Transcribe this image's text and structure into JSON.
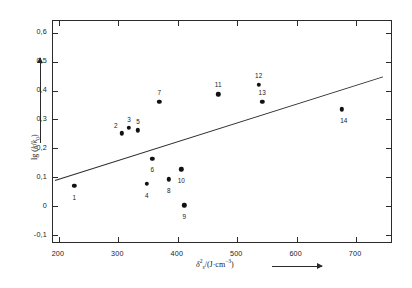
{
  "chart_data": {
    "type": "scatter",
    "title": "",
    "xlabel": "δ²ₛ/(J·cm⁻³)",
    "ylabel": "lg (k/k₀)",
    "xlim": [
      190,
      762
    ],
    "ylim": [
      -0.13,
      0.64
    ],
    "grid": false,
    "legend": null,
    "xticks": [
      200,
      300,
      400,
      500,
      600,
      700
    ],
    "xtick_labels": [
      "200",
      "300",
      "400",
      "500",
      "600",
      "700"
    ],
    "yticks": [
      -0.1,
      0,
      0.1,
      0.2,
      0.3,
      0.4,
      0.5,
      0.6
    ],
    "ytick_labels": [
      "-0,1",
      "0",
      "0,1",
      "0,2",
      "0,3",
      "0,4",
      "0,5",
      "0,6"
    ],
    "points": [
      {
        "id": "1",
        "x": 226,
        "y": 0.072,
        "label_dx": 0,
        "label_dy": 11
      },
      {
        "id": "2",
        "x": 306,
        "y": 0.252,
        "label_dx": -6,
        "label_dy": -8
      },
      {
        "id": "3",
        "x": 318,
        "y": 0.272,
        "label_dx": 0,
        "label_dy": -9
      },
      {
        "id": "4",
        "x": 348,
        "y": 0.078,
        "label_dx": 0,
        "label_dy": 11
      },
      {
        "id": "5",
        "x": 333,
        "y": 0.262,
        "label_dx": 0,
        "label_dy": -9
      },
      {
        "id": "6",
        "x": 357,
        "y": 0.165,
        "label_dx": 0,
        "label_dy": 10
      },
      {
        "id": "7",
        "x": 369,
        "y": 0.362,
        "label_dx": 0,
        "label_dy": -10
      },
      {
        "id": "8",
        "x": 385,
        "y": 0.093,
        "label_dx": 0,
        "label_dy": 11
      },
      {
        "id": "9",
        "x": 411,
        "y": 0.003,
        "label_dx": 0,
        "label_dy": 11
      },
      {
        "id": "10",
        "x": 406,
        "y": 0.128,
        "label_dx": 0,
        "label_dy": 11
      },
      {
        "id": "11",
        "x": 468,
        "y": 0.387,
        "label_dx": 0,
        "label_dy": -10
      },
      {
        "id": "12",
        "x": 536,
        "y": 0.42,
        "label_dx": 0,
        "label_dy": -10
      },
      {
        "id": "13",
        "x": 542,
        "y": 0.362,
        "label_dx": 0,
        "label_dy": -10
      },
      {
        "id": "14",
        "x": 676,
        "y": 0.335,
        "label_dx": 2,
        "label_dy": 11
      }
    ],
    "trendline": {
      "type": "line",
      "x_start": 193,
      "y_start": 0.092,
      "x_end": 745,
      "y_end": 0.45
    }
  },
  "axis_arrows": {
    "x_arrow_name": "x-axis-direction-arrow",
    "y_arrow_name": "y-axis-direction-arrow"
  }
}
